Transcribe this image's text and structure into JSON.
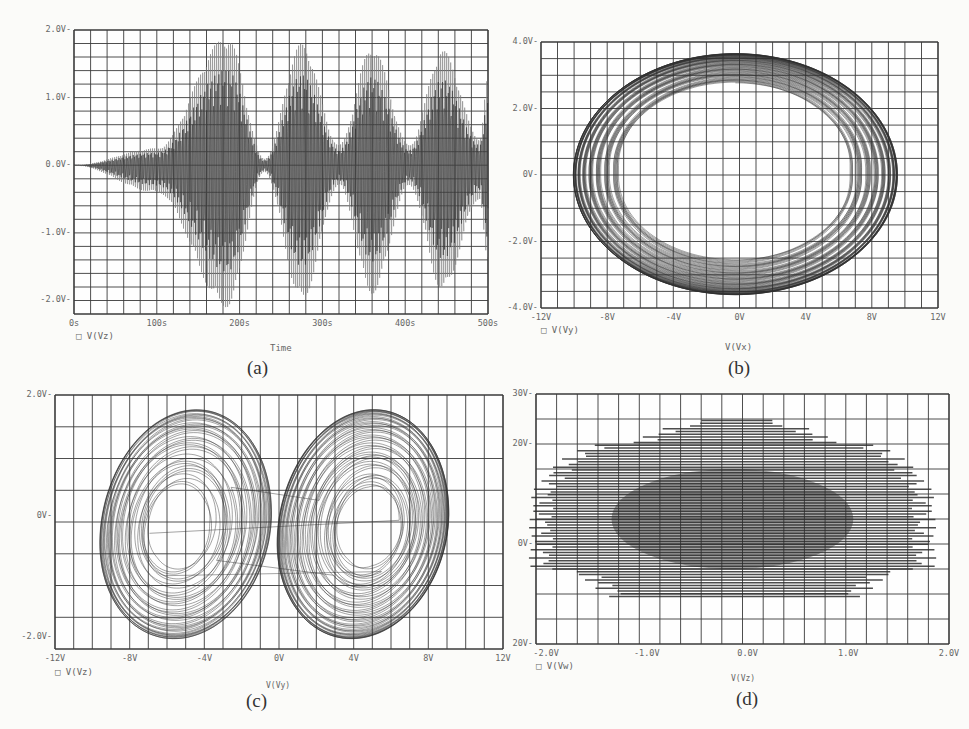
{
  "colors": {
    "grid": "#3a3a3a",
    "trace": "#2e2e2e",
    "trace_light": "#7a7a7a",
    "background": "#fbfbf9"
  },
  "chart_data": [
    {
      "id": "a",
      "type": "line",
      "caption": "(a)",
      "title": "",
      "xlabel": "Time",
      "ylabel": "",
      "legend": [
        "V(Vz)"
      ],
      "legend_marker": "square",
      "xlim": [
        0,
        500
      ],
      "ylim": [
        -2.2,
        2.0
      ],
      "xticks": [
        "0s",
        "100s",
        "200s",
        "300s",
        "400s",
        "500s"
      ],
      "yticks": [
        "2.0V",
        "1.0V",
        "0.0V",
        "-1.0V",
        "-2.0V"
      ],
      "ytick_values": [
        2.0,
        1.0,
        0.0,
        -1.0,
        -2.0
      ],
      "grid": true,
      "grid_divisions": {
        "x": 25,
        "y": 21
      },
      "series": [
        {
          "name": "V(Vz)",
          "description": "Growing oscillation with beating envelope",
          "envelope_peaks": [
            {
              "t": 0,
              "max": 0.0,
              "min": 0.0
            },
            {
              "t": 100,
              "max": 0.25,
              "min": -0.4
            },
            {
              "t": 185,
              "max": 1.9,
              "min": -2.1
            },
            {
              "t": 230,
              "max": 0.1,
              "min": -0.1
            },
            {
              "t": 275,
              "max": 1.8,
              "min": -2.0
            },
            {
              "t": 320,
              "max": 0.3,
              "min": -0.3
            },
            {
              "t": 360,
              "max": 1.75,
              "min": -1.9
            },
            {
              "t": 405,
              "max": 0.3,
              "min": -0.3
            },
            {
              "t": 445,
              "max": 1.7,
              "min": -1.85
            },
            {
              "t": 490,
              "max": 0.4,
              "min": -0.5
            },
            {
              "t": 500,
              "max": 1.3,
              "min": -1.5
            }
          ]
        }
      ]
    },
    {
      "id": "b",
      "type": "line",
      "caption": "(b)",
      "title": "",
      "xlabel": "V(Vx)",
      "ylabel": "",
      "legend": [
        "V(Vy)"
      ],
      "legend_marker": "square",
      "xlim": [
        -12,
        12
      ],
      "ylim": [
        -4,
        4
      ],
      "xticks": [
        "-12V",
        "-8V",
        "-4V",
        "0V",
        "4V",
        "8V",
        "12V"
      ],
      "yticks": [
        "4.0V",
        "2.0V",
        "0V",
        "-2.0V",
        "-4.0V"
      ],
      "ytick_values": [
        4,
        2,
        0,
        -2,
        -4
      ],
      "grid": true,
      "grid_divisions": {
        "x": 24,
        "y": 16
      },
      "series": [
        {
          "name": "V(Vy) vs V(Vx)",
          "description": "Torus-like phase portrait",
          "extent": {
            "xmin": -10.0,
            "xmax": 9.5,
            "ymin": -3.6,
            "ymax": 3.7
          }
        }
      ]
    },
    {
      "id": "c",
      "type": "line",
      "caption": "(c)",
      "title": "",
      "xlabel": "V(Vy)",
      "ylabel": "",
      "legend": [
        "V(Vz)"
      ],
      "legend_marker": "square",
      "xlim": [
        -12,
        12
      ],
      "ylim": [
        -2.2,
        2.0
      ],
      "xticks": [
        "-12V",
        "-8V",
        "-4V",
        "0V",
        "4V",
        "8V",
        "12V"
      ],
      "yticks": [
        "2.0V",
        "0V",
        "-2.0V"
      ],
      "ytick_values": [
        2.0,
        0.0,
        -2.0
      ],
      "grid": true,
      "grid_divisions": {
        "x": 24,
        "y": 8
      },
      "series": [
        {
          "name": "V(Vz) vs V(Vy)",
          "description": "Butterfly-shaped chaotic attractor",
          "extent": {
            "xmin": -10.3,
            "xmax": 9.5,
            "ymin": -2.05,
            "ymax": 1.95
          },
          "lobe_centers": [
            {
              "x": -5.5,
              "y": -0.2
            },
            {
              "x": 5.0,
              "y": -0.1
            }
          ]
        }
      ]
    },
    {
      "id": "d",
      "type": "line",
      "caption": "(d)",
      "title": "",
      "xlabel": "V(Vz)",
      "ylabel": "",
      "legend": [
        "V(Vw)"
      ],
      "legend_marker": "square",
      "xlim": [
        -2.1,
        2.0
      ],
      "ylim": [
        -20,
        30
      ],
      "xticks": [
        "-2.0V",
        "-1.0V",
        "0.0V",
        "1.0V",
        "2.0V"
      ],
      "xtick_values": [
        -2.0,
        -1.0,
        0.0,
        1.0,
        2.0
      ],
      "yticks": [
        "30V",
        "20V",
        "0V",
        "20V"
      ],
      "ytick_values": [
        30,
        20,
        0,
        -20
      ],
      "grid": true,
      "grid_divisions": {
        "x": 20,
        "y": 10
      },
      "series": [
        {
          "name": "V(Vw) vs V(Vz)",
          "description": "Dense horizontal striations forming dome shape",
          "extent": {
            "xmin": -2.0,
            "xmax": 1.9,
            "ymin": -10.5,
            "ymax": 25
          }
        }
      ]
    }
  ]
}
